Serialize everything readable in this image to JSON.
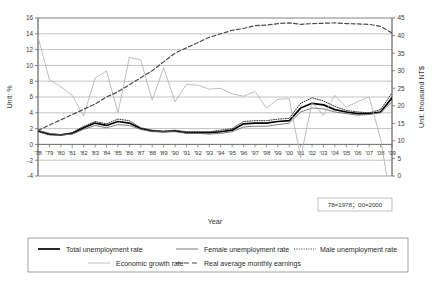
{
  "chart_data": {
    "type": "line",
    "title": "",
    "xlabel": "Year",
    "ylabel": "Unit: %",
    "y2label": "Unit: thousand NT$",
    "ylim": [
      -4,
      16
    ],
    "y2lim": [
      0,
      45
    ],
    "yticks": [
      16,
      14,
      12,
      10,
      8,
      6,
      4,
      2,
      0,
      -2,
      -4
    ],
    "y2ticks": [
      45,
      40,
      35,
      30,
      25,
      20,
      15,
      10,
      5,
      0
    ],
    "grid": true,
    "legend_position": "bottom",
    "note": "78=1978；00=2000",
    "x": [
      "78",
      "79",
      "80",
      "81",
      "82",
      "83",
      "84",
      "85",
      "86",
      "87",
      "88",
      "89",
      "90",
      "91",
      "92",
      "93",
      "94",
      "95",
      "96",
      "97",
      "98",
      "99",
      "00",
      "01",
      "02",
      "03",
      "04",
      "05",
      "06",
      "07",
      "08",
      "09"
    ],
    "xticklabels": [
      "'78",
      "'79",
      "'80",
      "'81",
      "'82",
      "'83",
      "'84",
      "'85",
      "'86",
      "'87",
      "'88",
      "'89",
      "'90",
      "'91",
      "'92",
      "'93",
      "'94",
      "'95",
      "'96",
      "'97",
      "'98",
      "'99",
      "'00",
      "'01",
      "'02",
      "'03",
      "'04",
      "'05",
      "'06",
      "'07",
      "'08",
      "'09"
    ],
    "series": [
      {
        "name": "Total unemployment rate",
        "axis": "left",
        "style": "solid-thick",
        "color": "#000000",
        "values": [
          1.7,
          1.3,
          1.2,
          1.4,
          2.1,
          2.7,
          2.4,
          2.9,
          2.7,
          2.0,
          1.7,
          1.6,
          1.7,
          1.5,
          1.5,
          1.5,
          1.6,
          1.8,
          2.6,
          2.7,
          2.7,
          2.9,
          3.0,
          4.6,
          5.2,
          5.0,
          4.4,
          4.1,
          3.9,
          3.9,
          4.1,
          5.9
        ]
      },
      {
        "name": "Female unemployment rate",
        "axis": "left",
        "style": "solid-thin",
        "color": "#6e6e6e",
        "values": [
          1.8,
          1.4,
          1.2,
          1.3,
          1.9,
          2.4,
          2.1,
          2.5,
          2.4,
          1.9,
          1.6,
          1.6,
          1.6,
          1.4,
          1.4,
          1.3,
          1.4,
          1.6,
          2.2,
          2.3,
          2.3,
          2.5,
          2.7,
          4.1,
          4.6,
          4.5,
          4.1,
          3.9,
          3.7,
          3.8,
          4.0,
          5.4
        ]
      },
      {
        "name": "Male unemployment rate",
        "axis": "left",
        "style": "dotted",
        "color": "#333333",
        "values": [
          1.6,
          1.2,
          1.2,
          1.5,
          2.3,
          2.9,
          2.6,
          3.2,
          3.0,
          2.1,
          1.8,
          1.7,
          1.8,
          1.6,
          1.6,
          1.6,
          1.8,
          2.0,
          2.9,
          3.0,
          3.0,
          3.2,
          3.3,
          5.2,
          5.9,
          5.5,
          4.8,
          4.3,
          4.1,
          4.0,
          4.4,
          6.5
        ]
      },
      {
        "name": "Economic growth rate",
        "axis": "left",
        "style": "solid-light",
        "color": "#adadad",
        "values": [
          13.6,
          8.2,
          7.3,
          6.2,
          3.6,
          8.4,
          9.3,
          4.0,
          11.0,
          10.7,
          5.6,
          9.7,
          5.4,
          7.6,
          7.5,
          7.0,
          7.1,
          6.4,
          6.1,
          6.7,
          4.6,
          5.7,
          5.8,
          -1.7,
          5.3,
          3.7,
          6.2,
          4.7,
          5.4,
          6.0,
          0.7,
          -8.0
        ]
      },
      {
        "name": "Real average monthly earnings",
        "axis": "right",
        "style": "dashed",
        "color": "#4a4a4a",
        "values": [
          13.0,
          14.5,
          16.0,
          17.5,
          19.0,
          20.5,
          22.5,
          24.0,
          26.0,
          28.0,
          30.0,
          32.5,
          35.0,
          36.5,
          38.0,
          39.5,
          40.5,
          41.5,
          42.0,
          42.8,
          43.0,
          43.4,
          43.6,
          43.2,
          43.4,
          43.5,
          43.6,
          43.4,
          43.3,
          43.2,
          42.6,
          40.7
        ]
      }
    ]
  },
  "legend": {
    "items": [
      {
        "label": "Total unemployment rate",
        "style": "solid-thick"
      },
      {
        "label": "Female unemployment rate",
        "style": "solid-thin"
      },
      {
        "label": "Male unemployment rate",
        "style": "dotted"
      },
      {
        "label": "Economic growth rate",
        "style": "solid-light"
      },
      {
        "label": "Real average monthly earnings",
        "style": "dashed"
      }
    ]
  }
}
